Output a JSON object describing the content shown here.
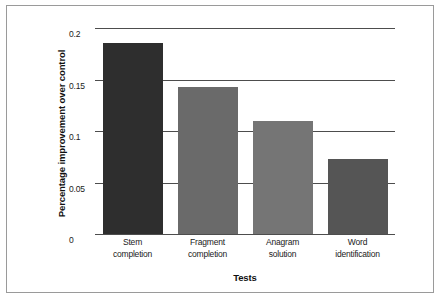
{
  "chart_data": {
    "type": "bar",
    "title": "",
    "subtitle": "",
    "xlabel": "Tests",
    "ylabel": "Percentage improvement over control",
    "categories": [
      "Stem completion",
      "Fragment completion",
      "Anagram solution",
      "Word identification"
    ],
    "category_lines": [
      [
        "Stem",
        "completion"
      ],
      [
        "Fragment",
        "completion"
      ],
      [
        "Anagram",
        "solution"
      ],
      [
        "Word",
        "identification"
      ]
    ],
    "values": [
      0.185,
      0.1425,
      0.11,
      0.0725
    ],
    "bar_colors": [
      "#2e2e2e",
      "#6a6a6a",
      "#757575",
      "#555555"
    ],
    "ylim": [
      0,
      0.2
    ],
    "yticks": [
      0,
      0.05,
      0.1,
      0.15,
      0.2
    ],
    "ytick_labels": [
      "0",
      "0.05",
      "0.1",
      "0.15",
      "0.2"
    ],
    "grid": true,
    "grid_axis": "y",
    "grid_color": "#4d4d4d",
    "legend": false,
    "legend_position": "none",
    "background_color": "#ffffff",
    "frame_color": "#9a9a9a"
  }
}
